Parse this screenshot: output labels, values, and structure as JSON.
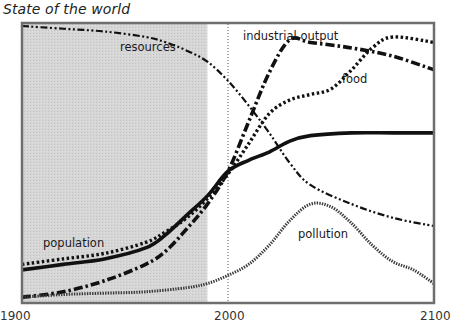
{
  "title": "State of the world",
  "chart_data": {
    "type": "line",
    "title": "State of the world",
    "xlabel": "",
    "ylabel": "",
    "xlim": [
      1900,
      2100
    ],
    "ylim": [
      0,
      100
    ],
    "x_ticks": [
      "1900",
      "2000",
      "2100"
    ],
    "grid": false,
    "legend": "inline labels",
    "annotations": [
      {
        "type": "shaded_region",
        "x": [
          1900,
          1990
        ],
        "color": "#d3d3d3"
      },
      {
        "type": "vertical_dotted_line",
        "x": 2000
      }
    ],
    "series": [
      {
        "name": "resources",
        "style": "dash-dot-dot",
        "x": [
          1900,
          1920,
          1940,
          1960,
          1970,
          1980,
          1990,
          2000,
          2010,
          2020,
          2030,
          2040,
          2060,
          2080,
          2100
        ],
        "values": [
          100,
          99,
          98,
          96,
          94,
          91,
          87,
          80,
          71,
          61,
          50,
          42,
          35,
          30,
          27
        ]
      },
      {
        "name": "industrial output",
        "style": "dash-dot",
        "x": [
          1900,
          1920,
          1940,
          1960,
          1970,
          1980,
          1990,
          2000,
          2010,
          2020,
          2030,
          2040,
          2060,
          2080,
          2100
        ],
        "values": [
          1,
          3,
          7,
          13,
          18,
          26,
          35,
          47,
          65,
          83,
          95,
          94,
          92,
          89,
          84
        ]
      },
      {
        "name": "food",
        "style": "dotted",
        "x": [
          1900,
          1920,
          1940,
          1960,
          1970,
          1980,
          1990,
          2000,
          2010,
          2020,
          2030,
          2040,
          2050,
          2060,
          2070,
          2080,
          2100
        ],
        "values": [
          13,
          15,
          17,
          21,
          25,
          30,
          37,
          46,
          57,
          68,
          73,
          75,
          77,
          84,
          92,
          96,
          94
        ]
      },
      {
        "name": "population",
        "style": "solid",
        "x": [
          1900,
          1920,
          1940,
          1960,
          1970,
          1980,
          1990,
          2000,
          2010,
          2020,
          2030,
          2040,
          2060,
          2080,
          2100
        ],
        "values": [
          11,
          13,
          15,
          19,
          24,
          31,
          38,
          47,
          51,
          54,
          58,
          60,
          61,
          61,
          61
        ]
      },
      {
        "name": "pollution",
        "style": "dense-dotted",
        "x": [
          1900,
          1920,
          1940,
          1960,
          1980,
          1990,
          2000,
          2010,
          2020,
          2030,
          2040,
          2050,
          2060,
          2070,
          2080,
          2090,
          2100
        ],
        "values": [
          1,
          2,
          2.5,
          3,
          4.5,
          6,
          9,
          13,
          20,
          29,
          35,
          34,
          28,
          20,
          14,
          11,
          6
        ]
      }
    ]
  },
  "labels": {
    "resources": "resources",
    "industrial_output": "industrial output",
    "food": "food",
    "population": "population",
    "pollution": "pollution"
  },
  "axis": {
    "x_min_label": "1900",
    "x_mid_label": "2000",
    "x_max_label": "2100"
  }
}
